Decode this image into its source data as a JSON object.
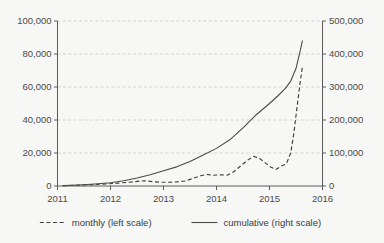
{
  "chart_data": {
    "type": "line",
    "title": "",
    "subtitle": "",
    "xlabel": "",
    "ylabel": "",
    "y2label": "",
    "grid": true,
    "legend_position": "bottom",
    "xlim": [
      2011,
      2016
    ],
    "ylim": [
      0,
      100000
    ],
    "y2lim": [
      0,
      500000
    ],
    "x_ticks": [
      2011,
      2012,
      2013,
      2014,
      2015,
      2016
    ],
    "x_tick_labels": [
      "2011",
      "2012",
      "2013",
      "2014",
      "2015",
      "2016"
    ],
    "y_ticks": [
      0,
      20000,
      40000,
      60000,
      80000,
      100000
    ],
    "y_tick_labels": [
      "0",
      "20,000",
      "40,000",
      "60,000",
      "80,000",
      "100,000"
    ],
    "y2_ticks": [
      0,
      100000,
      200000,
      300000,
      400000,
      500000
    ],
    "y2_tick_labels": [
      "0",
      "100,000",
      "200,000",
      "300,000",
      "400,000",
      "500,000"
    ],
    "series": [
      {
        "name": "monthly (left scale)",
        "axis": "left",
        "style": "dashed",
        "color": "#3d3d3d",
        "x": [
          2011.1,
          2011.3,
          2011.5,
          2011.7,
          2011.9,
          2012.05,
          2012.2,
          2012.35,
          2012.5,
          2012.65,
          2012.8,
          2012.95,
          2013.1,
          2013.25,
          2013.4,
          2013.55,
          2013.7,
          2013.82,
          2013.95,
          2014.08,
          2014.2,
          2014.32,
          2014.45,
          2014.58,
          2014.7,
          2014.82,
          2014.92,
          2015.02,
          2015.12,
          2015.22,
          2015.32,
          2015.4,
          2015.46,
          2015.52,
          2015.58,
          2015.62
        ],
        "y": [
          200,
          350,
          600,
          900,
          1200,
          1500,
          1900,
          2300,
          2800,
          3200,
          2600,
          2300,
          2300,
          2500,
          3000,
          4500,
          6200,
          7000,
          6500,
          6800,
          6500,
          8500,
          12000,
          15500,
          18000,
          16500,
          14000,
          11500,
          10000,
          12000,
          13500,
          20000,
          32000,
          48000,
          63000,
          72000
        ]
      },
      {
        "name": "cumulative (right scale)",
        "axis": "right",
        "style": "solid",
        "color": "#4a4a4a",
        "x": [
          2011.1,
          2011.4,
          2011.7,
          2012.0,
          2012.25,
          2012.5,
          2012.75,
          2013.0,
          2013.25,
          2013.5,
          2013.75,
          2014.0,
          2014.25,
          2014.5,
          2014.75,
          2015.0,
          2015.15,
          2015.3,
          2015.4,
          2015.5,
          2015.58,
          2015.62
        ],
        "y": [
          1000,
          3000,
          6000,
          10000,
          16000,
          24000,
          34000,
          46000,
          58000,
          74000,
          94000,
          114000,
          140000,
          176000,
          216000,
          250000,
          272000,
          296000,
          318000,
          356000,
          410000,
          440000
        ]
      }
    ],
    "legend": [
      {
        "label": "monthly (left scale)",
        "style": "dashed"
      },
      {
        "label": "cumulative (right scale)",
        "style": "solid"
      }
    ]
  }
}
